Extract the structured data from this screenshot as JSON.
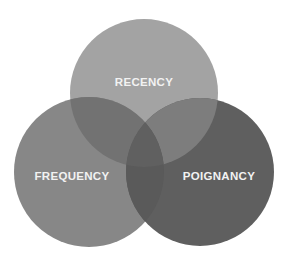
{
  "diagram": {
    "type": "venn",
    "sets": [
      {
        "id": "recency",
        "label": "RECENCY",
        "cx": 144,
        "cy": 93,
        "r": 74,
        "color": "#a3a3a3",
        "label_x": 144,
        "label_y": 86
      },
      {
        "id": "frequency",
        "label": "FREQUENCY",
        "cx": 89,
        "cy": 172,
        "r": 75,
        "color": "#878787",
        "label_x": 72,
        "label_y": 180
      },
      {
        "id": "poignancy",
        "label": "POIGNANCY",
        "cx": 200,
        "cy": 172,
        "r": 74,
        "color": "#5f5f5f",
        "label_x": 219,
        "label_y": 180
      }
    ],
    "overlap_colors": {
      "recency_frequency": "#727272",
      "recency_poignancy": "#7d7d7d",
      "frequency_poignancy": "#5a5a5a",
      "center": "#606060"
    },
    "label_color": "#f2f2f2"
  }
}
